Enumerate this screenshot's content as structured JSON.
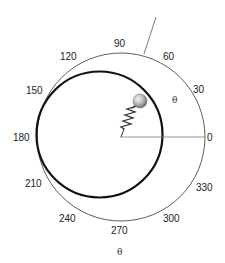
{
  "diagram": {
    "type": "polar-plot-with-spring-pendulum",
    "angle_labels": [
      {
        "value": "0",
        "x": 207,
        "y": 141
      },
      {
        "value": "30",
        "x": 193,
        "y": 93
      },
      {
        "value": "60",
        "x": 163,
        "y": 60
      },
      {
        "value": "90",
        "x": 115,
        "y": 48
      },
      {
        "value": "120",
        "x": 60,
        "y": 60
      },
      {
        "value": "150",
        "x": 26,
        "y": 94
      },
      {
        "value": "180",
        "x": 14,
        "y": 141
      },
      {
        "value": "210",
        "x": 25,
        "y": 187
      },
      {
        "value": "240",
        "x": 59,
        "y": 222
      },
      {
        "value": "270",
        "x": 111,
        "y": 234
      },
      {
        "value": "300",
        "x": 163,
        "y": 222
      },
      {
        "value": "330",
        "x": 196,
        "y": 190
      }
    ],
    "inner_theta_label": "θ",
    "bottom_theta_label": "θ",
    "colors": {
      "outer_circle": "#333333",
      "trajectory": "#111111",
      "axis_line": "#777777",
      "spring": "#333333",
      "ball_light": "#f2f2f2",
      "ball_dark": "#6a6a6a"
    },
    "geometry": {
      "center": [
        121,
        137
      ],
      "outer_radius": 84,
      "trajectory_center": [
        99.5,
        134.5
      ],
      "trajectory_radius": 63,
      "ball": [
        140,
        102
      ],
      "ball_radius": 7
    }
  }
}
